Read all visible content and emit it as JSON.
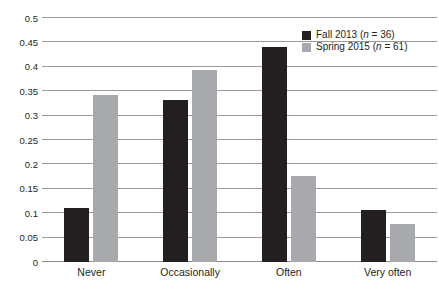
{
  "chart_data": {
    "type": "bar",
    "title": "",
    "xlabel": "",
    "ylabel": "",
    "categories": [
      "Never",
      "Occasionally",
      "Often",
      "Very often"
    ],
    "series": [
      {
        "name": "Fall 2013 (n = 36)",
        "legend_prefix": "Fall 2013 (",
        "legend_italic": "n",
        "legend_suffix": " = 36)",
        "color": "#231f20",
        "values": [
          0.11,
          0.333,
          0.44,
          0.107
        ]
      },
      {
        "name": "Spring 2015 (n = 61)",
        "legend_prefix": "Spring 2015 (",
        "legend_italic": "n",
        "legend_suffix": " = 61)",
        "color": "#a7a9ac",
        "values": [
          0.343,
          0.393,
          0.177,
          0.078
        ]
      }
    ],
    "ylim": [
      0,
      0.5
    ],
    "ytick_values": [
      0,
      0.05,
      0.1,
      0.15,
      0.2,
      0.25,
      0.3,
      0.35,
      0.4,
      0.45,
      0.5
    ],
    "ytick_labels": [
      "0",
      "0.05",
      "0.1",
      "0.15",
      "0.2",
      "0.25",
      "0.3",
      "0.35",
      "0.4",
      "0.45",
      "0.5"
    ],
    "grid": true,
    "legend_position": "top-right-inside"
  }
}
